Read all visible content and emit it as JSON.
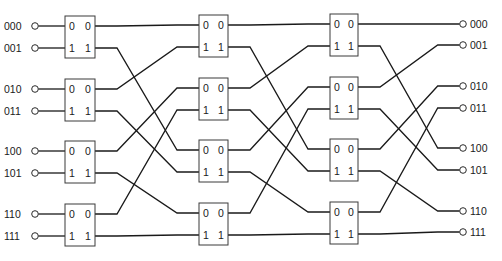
{
  "diagram": {
    "type": "omega-network",
    "stages": 3,
    "switches_per_stage": 4,
    "switch_port_labels": {
      "inputs": [
        "0",
        "1"
      ],
      "outputs": [
        "0",
        "1"
      ]
    },
    "inputs": [
      "000",
      "001",
      "010",
      "011",
      "100",
      "101",
      "110",
      "111"
    ],
    "outputs": [
      "000",
      "001",
      "010",
      "011",
      "100",
      "101",
      "110",
      "111"
    ],
    "interstage_permutation": [
      0,
      4,
      1,
      5,
      2,
      6,
      3,
      7
    ],
    "colors": {
      "line": "#1a1a1a",
      "box": "#3a3a3a",
      "background": "#ffffff"
    }
  }
}
